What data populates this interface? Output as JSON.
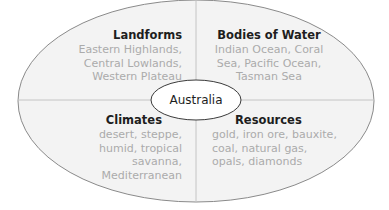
{
  "diagram": {
    "type": "four-quadrant concept web",
    "center": {
      "label": "Australia"
    },
    "quadrants": [
      {
        "position": "top-left",
        "title": "Landforms",
        "lines": [
          "Eastern Highlands,",
          "Central Lowlands,",
          "Western Plateau"
        ]
      },
      {
        "position": "top-right",
        "title": "Bodies of Water",
        "lines": [
          "Indian Ocean, Coral",
          "Sea, Pacific Ocean,",
          "Tasman Sea"
        ]
      },
      {
        "position": "bottom-left",
        "title": "Climates",
        "lines": [
          "desert, steppe,",
          "humid, tropical",
          "savanna,",
          "Mediterranean"
        ]
      },
      {
        "position": "bottom-right",
        "title": "Resources",
        "lines": [
          "gold, iron ore, bauxite,",
          "coal, natural gas,",
          "opals, diamonds"
        ]
      }
    ],
    "colors": {
      "ellipse_fill": "#f3f3f3",
      "ellipse_stroke": "#8a8a8a",
      "divider": "#c4c4c4",
      "title_text": "#1e1e1e",
      "body_text": "#ababab",
      "center_fill": "#ffffff"
    }
  }
}
